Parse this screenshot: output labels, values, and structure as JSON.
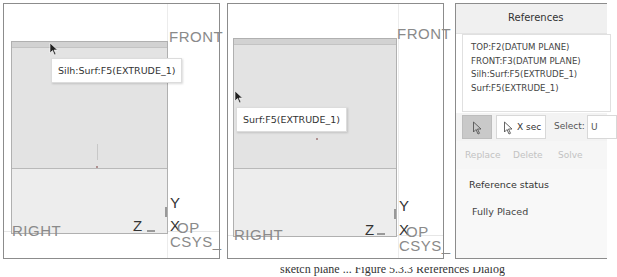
{
  "panels": [
    {
      "tooltip": "Silh:Surf:F5(EXTRUDE_1)",
      "labels": {
        "front": "FRONT",
        "right": "RIGHT",
        "top": "TOP",
        "csys": "CSYS_",
        "axis_y": "Y",
        "axis_z": "Z",
        "axis_x": "X"
      }
    },
    {
      "tooltip": "Surf:F5(EXTRUDE_1)",
      "labels": {
        "front": "FRONT",
        "right": "RIGHT",
        "top": "TOP",
        "csys": "CSYS_",
        "axis_y": "Y",
        "axis_z": "Z",
        "axis_x": "X"
      }
    }
  ],
  "references_dialog": {
    "title": "References",
    "items": [
      "TOP:F2(DATUM PLANE)",
      "FRONT:F3(DATUM PLANE)",
      "Silh:Surf:F5(EXTRUDE_1)",
      "Surf:F5(EXTRUDE_1)"
    ],
    "select_button_icon": "arrow-cursor-icon",
    "xsec_label": "X sec",
    "select_label": "Select:",
    "select_value": "U",
    "actions": {
      "replace": "Replace",
      "delete": "Delete",
      "solve": "Solve"
    },
    "status_title": "Reference status",
    "status_value": "Fully Placed"
  },
  "caption": "sketch plane ... Figure 5.3.3 References Dialog"
}
